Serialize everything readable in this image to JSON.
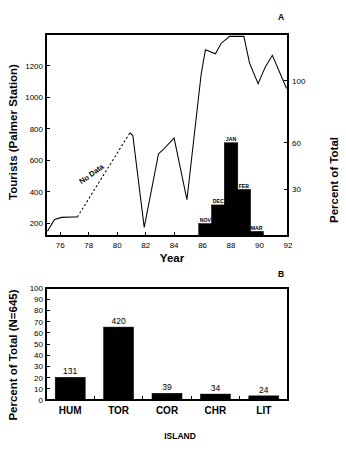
{
  "figure": {
    "panel_a_label": "A",
    "panel_b_label": "B"
  },
  "chart_data": [
    {
      "id": "panel-a-line",
      "type": "line",
      "title": "",
      "panel": "A",
      "xlabel": "Year",
      "ylabel": "Tourists (Palmer Station)",
      "y2label": "Percent of Total",
      "xlim": [
        75,
        92
      ],
      "ylim": [
        120,
        1400
      ],
      "y2lim": [
        0,
        130
      ],
      "grid": false,
      "legend": "none",
      "xticks": [
        76,
        78,
        80,
        82,
        84,
        86,
        88,
        90,
        92
      ],
      "xticklabels": [
        "76",
        "78",
        "80",
        "82",
        "84",
        "86",
        "88",
        "90",
        "92"
      ],
      "yticks": [
        200,
        400,
        600,
        800,
        1000,
        1200
      ],
      "yticklabels": [
        "200",
        "400",
        "600",
        "800",
        "1000",
        "1200"
      ],
      "y2ticks": [
        30,
        60,
        100
      ],
      "y2ticklabels": [
        "30",
        "60",
        "100"
      ],
      "annotations": [
        {
          "text": "No Data",
          "x": 78.3,
          "y": 500,
          "rotation": -36
        }
      ],
      "series": [
        {
          "name": "Tourists (observed, early)",
          "style": "solid",
          "x": [
            75.1,
            75.6,
            76.1,
            76.9,
            77.2
          ],
          "values": [
            150,
            225,
            238,
            240,
            240
          ]
        },
        {
          "name": "No Data (interpolated)",
          "style": "dashed",
          "x": [
            77.2,
            80.9
          ],
          "values": [
            240,
            775
          ]
        },
        {
          "name": "Tourists (observed, late)",
          "style": "solid",
          "x": [
            80.9,
            81.1,
            81.9,
            82.9,
            83.2,
            84.0,
            84.9,
            85.9,
            86.2,
            86.9,
            87.3,
            87.9,
            88.9,
            89.3,
            89.9,
            90.4,
            90.9,
            91.9
          ],
          "values": [
            775,
            755,
            175,
            640,
            665,
            740,
            350,
            1145,
            1300,
            1275,
            1340,
            1385,
            1385,
            1215,
            1085,
            1190,
            1265,
            1055
          ]
        }
      ]
    },
    {
      "id": "panel-a-inset-bars",
      "type": "bar",
      "panel": "A",
      "title": "",
      "xlabel": "",
      "ylabel": "Percent of Total",
      "ylim": [
        0,
        130
      ],
      "categories": [
        "NOV",
        "DEC",
        "JAN",
        "FEB",
        "MAR"
      ],
      "values": [
        8,
        20,
        60,
        30,
        3
      ],
      "bar_x_years": [
        86.2,
        87.1,
        88.0,
        88.9,
        89.8
      ]
    },
    {
      "id": "panel-b-bars",
      "type": "bar",
      "panel": "B",
      "title": "",
      "xlabel": "ISLAND",
      "ylabel": "Percent of Total (N=645)",
      "ylim": [
        0,
        100
      ],
      "grid": false,
      "legend": "none",
      "yticks": [
        0,
        10,
        20,
        30,
        40,
        50,
        60,
        70,
        80,
        90,
        100
      ],
      "yticklabels": [
        "0",
        "10",
        "20",
        "30",
        "40",
        "50",
        "60",
        "70",
        "80",
        "90",
        "100"
      ],
      "categories": [
        "HUM",
        "TOR",
        "COR",
        "CHR",
        "LIT"
      ],
      "values": [
        20.3,
        65.1,
        6.0,
        5.3,
        3.7
      ],
      "counts": [
        131,
        420,
        39,
        34,
        24
      ],
      "count_labels": [
        "131",
        "420",
        "39",
        "34",
        "24"
      ],
      "total_n": 645
    }
  ]
}
